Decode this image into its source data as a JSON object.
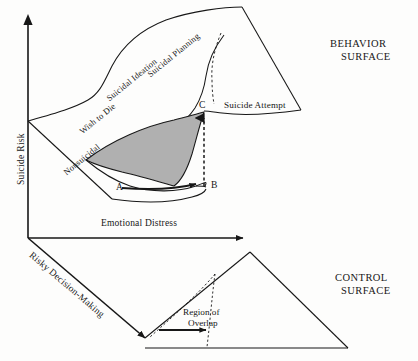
{
  "figure": {
    "background_color": "#fdfdfc",
    "ink_color": "#171717",
    "cusp_fill_color": "#b0b0b0"
  },
  "axes": {
    "y_axis_label": "Suicide Risk",
    "x_axis_label": "Emotional Distress",
    "z_axis_label": "Risky Decision-Making"
  },
  "behavior_surface": {
    "caption_line1": "BEHAVIOR",
    "caption_line2": "SURFACE",
    "regions": [
      {
        "label": "Nonsuicidal"
      },
      {
        "label": "Wish to Die"
      },
      {
        "label": "Suicidal Ideation"
      },
      {
        "label": "Suicidal Planning"
      },
      {
        "label": "Suicide Attempt"
      }
    ]
  },
  "control_surface": {
    "caption_line1": "CONTROL",
    "caption_line2": "SURFACE",
    "annotation_line1": "Region of",
    "annotation_line2": "Overlap"
  },
  "points": [
    {
      "id": "A",
      "label": "A"
    },
    {
      "id": "B",
      "label": "B"
    },
    {
      "id": "C",
      "label": "C"
    }
  ]
}
